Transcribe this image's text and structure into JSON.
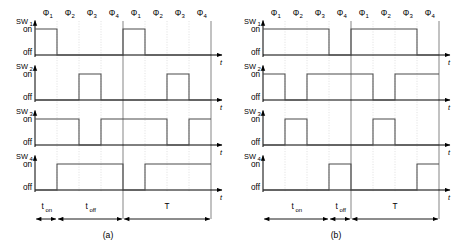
{
  "figure": {
    "panels": [
      {
        "id": "a",
        "caption": "(a)",
        "axis_label": "t",
        "level_labels": {
          "high": "on",
          "low": "off"
        },
        "phase_labels": [
          "Φ",
          "Φ",
          "Φ",
          "Φ",
          "Φ",
          "Φ",
          "Φ",
          "Φ"
        ],
        "phase_subscripts": [
          "1",
          "2",
          "3",
          "4",
          "1",
          "2",
          "3",
          "4"
        ],
        "signals": [
          {
            "name": "SW",
            "subscript": "1",
            "label": "SW₁",
            "pattern": [
              1,
              0,
              0,
              0,
              1,
              0,
              0,
              0
            ]
          },
          {
            "name": "SW",
            "subscript": "2",
            "label": "SW₂",
            "pattern": [
              0,
              0,
              1,
              0,
              0,
              0,
              1,
              0
            ]
          },
          {
            "name": "SW",
            "subscript": "3",
            "label": "SW₃",
            "pattern": [
              1,
              1,
              0,
              1,
              1,
              1,
              0,
              1
            ]
          },
          {
            "name": "SW",
            "subscript": "4",
            "label": "SW₄",
            "pattern": [
              0,
              1,
              1,
              1,
              0,
              1,
              1,
              1
            ]
          }
        ],
        "intervals": [
          {
            "name": "t",
            "subscript": "on",
            "label": "tₒₙ",
            "start_phase": 0,
            "end_phase": 1
          },
          {
            "name": "t",
            "subscript": "off",
            "label": "tₒꟳꟳ",
            "start_phase": 1,
            "end_phase": 4
          },
          {
            "name": "T",
            "subscript": "",
            "label": "T",
            "start_phase": 4,
            "end_phase": 8
          }
        ]
      },
      {
        "id": "b",
        "caption": "(b)",
        "axis_label": "t",
        "level_labels": {
          "high": "on",
          "low": "off"
        },
        "phase_labels": [
          "Φ",
          "Φ",
          "Φ",
          "Φ",
          "Φ",
          "Φ",
          "Φ",
          "Φ"
        ],
        "phase_subscripts": [
          "1",
          "2",
          "3",
          "4",
          "1",
          "2",
          "3",
          "4"
        ],
        "signals": [
          {
            "name": "SW",
            "subscript": "1",
            "label": "SW₁",
            "pattern": [
              1,
              1,
              1,
              0,
              1,
              1,
              1,
              0
            ]
          },
          {
            "name": "SW",
            "subscript": "2",
            "label": "SW₂",
            "pattern": [
              1,
              0,
              1,
              1,
              1,
              0,
              1,
              1
            ]
          },
          {
            "name": "SW",
            "subscript": "3",
            "label": "SW₃",
            "pattern": [
              0,
              1,
              0,
              0,
              0,
              1,
              0,
              0
            ]
          },
          {
            "name": "SW",
            "subscript": "4",
            "label": "SW₄",
            "pattern": [
              0,
              0,
              0,
              1,
              0,
              0,
              0,
              1
            ]
          }
        ],
        "intervals": [
          {
            "name": "t",
            "subscript": "on",
            "label": "tₒₙ",
            "start_phase": 0,
            "end_phase": 3
          },
          {
            "name": "t",
            "subscript": "off",
            "label": "tₒꟳꟳ",
            "start_phase": 3,
            "end_phase": 4
          },
          {
            "name": "T",
            "subscript": "",
            "label": "T",
            "start_phase": 4,
            "end_phase": 8
          }
        ]
      }
    ],
    "colors": {
      "waveform": "#4a4a4a",
      "axis": "#000000",
      "grid": "#c9c9c9",
      "cycle_divider": "#6f6f6f",
      "background": "#ffffff"
    }
  }
}
